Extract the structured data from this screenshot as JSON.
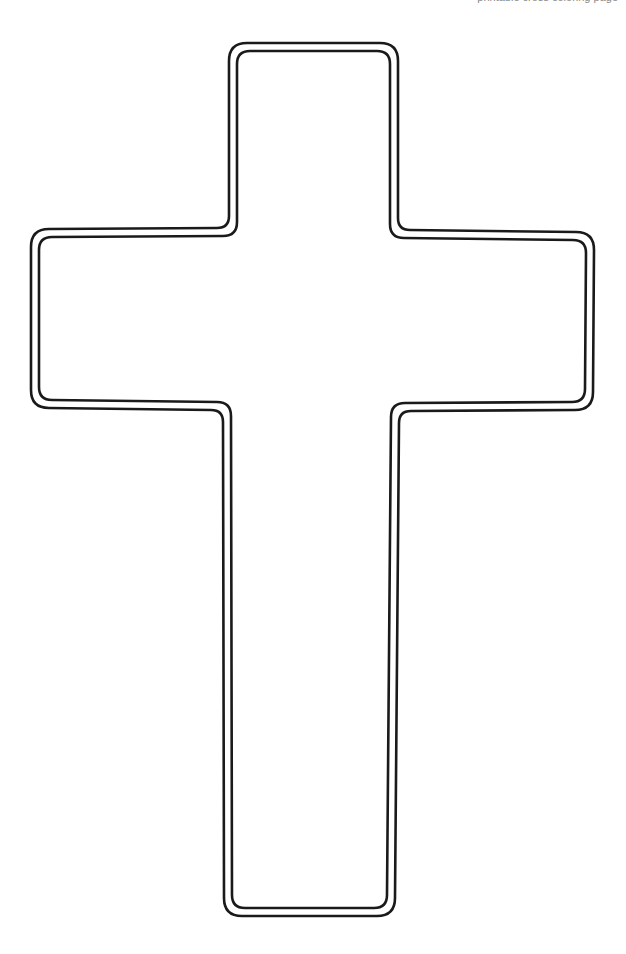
{
  "header": {
    "url_text": "printable cross coloring page"
  },
  "figure": {
    "shape": "cross-outline",
    "stroke_color": "#1a1a1a",
    "fill_color": "#ffffff",
    "background": "#ffffff"
  }
}
